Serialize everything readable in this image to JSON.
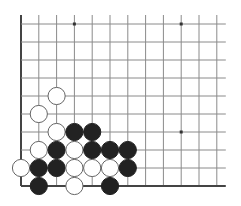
{
  "board": {
    "description": "Go problem diagram, lower-left corner",
    "columns": 12,
    "rows": 10,
    "origin_x": 21,
    "origin_y": 24,
    "spacing_x": 17.8,
    "spacing_y": 18,
    "line_extend_top": 9,
    "line_extend_right": 9,
    "edges": [
      "left",
      "bottom"
    ],
    "line_color": "#8a8a8a",
    "edge_color": "#444444",
    "stone_radius": 8.6,
    "black_color": "#222222",
    "white_fill": "#ffffff",
    "white_stroke": "#666666",
    "star_points": [
      {
        "col": 3,
        "row": 0
      },
      {
        "col": 9,
        "row": 0
      },
      {
        "col": 9,
        "row": 6
      }
    ],
    "stones": [
      {
        "color": "white",
        "col": 2,
        "row": 4
      },
      {
        "color": "white",
        "col": 1,
        "row": 5
      },
      {
        "color": "white",
        "col": 2,
        "row": 6
      },
      {
        "color": "black",
        "col": 3,
        "row": 6
      },
      {
        "color": "black",
        "col": 4,
        "row": 6
      },
      {
        "color": "white",
        "col": 1,
        "row": 7
      },
      {
        "color": "black",
        "col": 2,
        "row": 7
      },
      {
        "color": "white",
        "col": 3,
        "row": 7
      },
      {
        "color": "black",
        "col": 4,
        "row": 7
      },
      {
        "color": "black",
        "col": 5,
        "row": 7
      },
      {
        "color": "black",
        "col": 6,
        "row": 7
      },
      {
        "color": "white",
        "col": 0,
        "row": 8
      },
      {
        "color": "black",
        "col": 1,
        "row": 8
      },
      {
        "color": "black",
        "col": 2,
        "row": 8
      },
      {
        "color": "white",
        "col": 3,
        "row": 8
      },
      {
        "color": "white",
        "col": 4,
        "row": 8
      },
      {
        "color": "white",
        "col": 5,
        "row": 8
      },
      {
        "color": "black",
        "col": 6,
        "row": 8
      },
      {
        "color": "black",
        "col": 1,
        "row": 9
      },
      {
        "color": "white",
        "col": 3,
        "row": 9
      },
      {
        "color": "black",
        "col": 5,
        "row": 9
      }
    ]
  }
}
